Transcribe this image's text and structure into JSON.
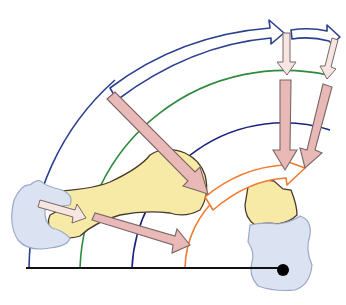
{
  "diagram": {
    "type": "biomechanics force-transmission schematic",
    "colors": {
      "outer_arc": "#2a3f8f",
      "green_arc": "#2e8b3e",
      "inner_arc": "#1a237e",
      "orange_arc": "#f07a2e",
      "force_arrow_fill": "#e8b9b6",
      "force_arrow_stroke": "#7a6666",
      "light_arrow_fill": "#f6e6e2",
      "bone_fill": "#f7e9a6",
      "bone_stroke": "#4a3a2a",
      "cartilage_fill": "#dbe3f3",
      "cartilage_stroke": "#9aa8c8",
      "baseline": "#111111",
      "pivot": "#000000"
    },
    "elements": {
      "concentric_arcs": [
        "outer-blue-arc",
        "green-arc",
        "inner-navy-arc",
        "orange-arc"
      ],
      "curved_arrows": [
        "outer-curved-arrow-1",
        "outer-curved-arrow-2",
        "orange-curved-arrow"
      ],
      "force_arrows": [
        "diagonal-force-arrow",
        "vertical-force-arrow-1",
        "vertical-force-arrow-2",
        "lower-force-arrow",
        "small-left-arrow"
      ],
      "bones": [
        "long-bone",
        "right-bone-block"
      ],
      "cartilage": [
        "left-cartilage",
        "right-cartilage"
      ],
      "pivot_point": "pivot-dot"
    }
  }
}
